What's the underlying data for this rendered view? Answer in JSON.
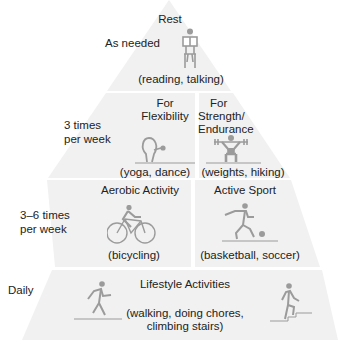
{
  "colors": {
    "tier_fill": "#f1f1f1",
    "gap": "#ffffff",
    "icon": "#9b9b9b",
    "text": "#222222"
  },
  "tiers": [
    {
      "frequency": "As needed",
      "sections": [
        {
          "title": "Rest",
          "examples": "(reading, talking)",
          "icon": "person-reading-seated-icon"
        }
      ]
    },
    {
      "frequency": "3 times per week",
      "frequency_lines": [
        "3 times",
        "per week"
      ],
      "sections": [
        {
          "title": "For Flexibility",
          "title_lines": [
            "For",
            "Flexibility"
          ],
          "examples": "(yoga, dance)",
          "icon": "yoga-stretch-icon"
        },
        {
          "title": "For Strength/ Endurance",
          "title_lines": [
            "For",
            "Strength/",
            "Endurance"
          ],
          "examples": "(weights, hiking)",
          "icon": "weightlifter-icon"
        }
      ]
    },
    {
      "frequency": "3–6 times per week",
      "frequency_lines": [
        "3–6 times",
        "per week"
      ],
      "sections": [
        {
          "title": "Aerobic Activity",
          "examples": "(bicycling)",
          "icon": "bicycle-rider-icon"
        },
        {
          "title": "Active Sport",
          "examples": "(basketball, soccer)",
          "icon": "soccer-player-icon"
        }
      ]
    },
    {
      "frequency": "Daily",
      "sections": [
        {
          "title": "Lifestyle Activities",
          "examples": "(walking, doing chores, climbing stairs)",
          "examples_lines": [
            "(walking, doing chores,",
            "climbing stairs)"
          ],
          "icons": [
            "walking-person-icon",
            "stair-climber-icon"
          ]
        }
      ]
    }
  ]
}
